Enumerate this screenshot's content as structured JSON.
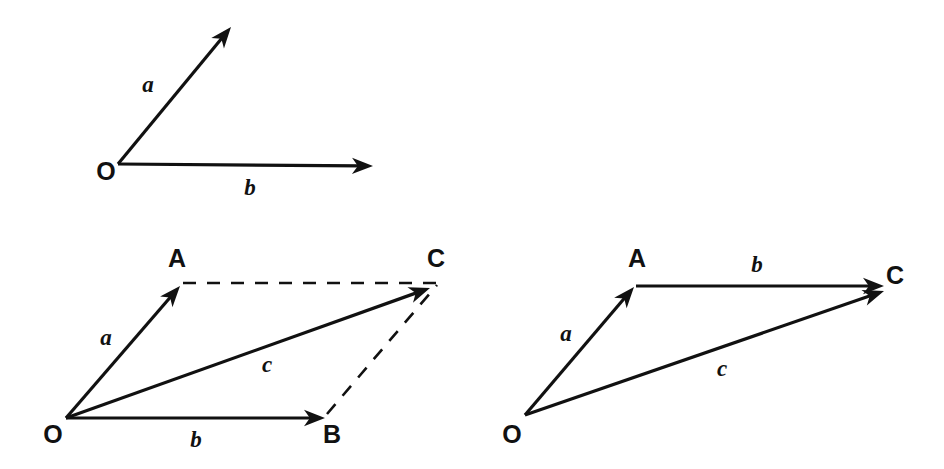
{
  "figure": {
    "background_color": "#ffffff",
    "ink_color": "#111111",
    "width": 944,
    "height": 469
  },
  "panels": [
    {
      "id": "panel-top-separate-vectors",
      "name": "two-vectors-from-common-origin",
      "description": "Vectors a and b drawn from a common origin O, not yet added",
      "points": [
        {
          "name": "O",
          "label": "O",
          "x": 118,
          "y": 164,
          "label_x": 106,
          "label_y": 180
        }
      ],
      "vectors": [
        {
          "name": "vector-a",
          "label": "a",
          "from": "O",
          "x1": 118,
          "y1": 164,
          "x2": 231,
          "y2": 27,
          "style": "solid",
          "arrow": "end",
          "label_x": 148,
          "label_y": 92
        },
        {
          "name": "vector-b",
          "label": "b",
          "from": "O",
          "x1": 118,
          "y1": 164,
          "x2": 373,
          "y2": 166,
          "style": "solid",
          "arrow": "end",
          "label_x": 250,
          "label_y": 195
        }
      ]
    },
    {
      "id": "panel-bottom-left-parallelogram",
      "name": "parallelogram-rule",
      "description": "Parallelogram law: c = a + b with dashed construction lines A-C and B-C",
      "points": [
        {
          "name": "O",
          "label": "O",
          "x": 66,
          "y": 418,
          "label_x": 53,
          "label_y": 443
        },
        {
          "name": "A",
          "label": "A",
          "x": 180,
          "y": 286,
          "label_x": 177,
          "label_y": 267
        },
        {
          "name": "B",
          "label": "B",
          "x": 325,
          "y": 418,
          "label_x": 332,
          "label_y": 443
        },
        {
          "name": "C",
          "label": "C",
          "x": 430,
          "y": 288,
          "label_x": 436,
          "label_y": 267
        }
      ],
      "vectors": [
        {
          "name": "vector-a",
          "label": "a",
          "from": "O",
          "to": "A",
          "x1": 66,
          "y1": 418,
          "x2": 180,
          "y2": 286,
          "style": "solid",
          "arrow": "end",
          "label_x": 106,
          "label_y": 345
        },
        {
          "name": "vector-b",
          "label": "b",
          "from": "O",
          "to": "B",
          "x1": 66,
          "y1": 418,
          "x2": 325,
          "y2": 418,
          "style": "solid",
          "arrow": "end",
          "label_x": 196,
          "label_y": 447
        },
        {
          "name": "vector-c-resultant",
          "label": "c",
          "from": "O",
          "to": "C",
          "x1": 66,
          "y1": 418,
          "x2": 430,
          "y2": 288,
          "style": "solid",
          "arrow": "end",
          "label_x": 267,
          "label_y": 372
        }
      ],
      "construction_lines": [
        {
          "name": "dashed-line-A-to-C",
          "from": "A",
          "to": "C",
          "x1": 183,
          "y1": 283,
          "x2": 437,
          "y2": 283,
          "style": "dashed"
        },
        {
          "name": "dashed-line-B-to-C",
          "from": "B",
          "to": "C",
          "x1": 327,
          "y1": 414,
          "x2": 437,
          "y2": 285,
          "style": "dashed"
        }
      ]
    },
    {
      "id": "panel-bottom-right-triangle",
      "name": "triangle-rule",
      "description": "Triangle law: vector b moved so its tail sits at A, giving c = a + b",
      "points": [
        {
          "name": "O",
          "label": "O",
          "x": 525,
          "y": 415,
          "label_x": 512,
          "label_y": 443
        },
        {
          "name": "A",
          "label": "A",
          "x": 634,
          "y": 287,
          "label_x": 637,
          "label_y": 267
        },
        {
          "name": "C",
          "label": "C",
          "x": 882,
          "y": 287,
          "label_x": 895,
          "label_y": 284
        }
      ],
      "vectors": [
        {
          "name": "vector-a",
          "label": "a",
          "from": "O",
          "to": "A",
          "x1": 525,
          "y1": 415,
          "x2": 634,
          "y2": 287,
          "style": "solid",
          "arrow": "end",
          "label_x": 566,
          "label_y": 341
        },
        {
          "name": "vector-b",
          "label": "b",
          "from": "A",
          "to": "C",
          "x1": 636,
          "y1": 286,
          "x2": 884,
          "y2": 286,
          "style": "solid",
          "arrow": "end",
          "label_x": 757,
          "label_y": 272
        },
        {
          "name": "vector-c-resultant",
          "label": "c",
          "from": "O",
          "to": "C",
          "x1": 525,
          "y1": 415,
          "x2": 884,
          "y2": 291,
          "style": "solid",
          "arrow": "end",
          "label_x": 722,
          "label_y": 376
        }
      ],
      "construction_lines": []
    }
  ]
}
